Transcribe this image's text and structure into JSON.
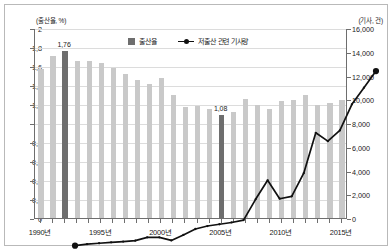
{
  "chart_data": {
    "type": "bar",
    "title": "",
    "subtitle": "",
    "xlabel": "",
    "ylabel": "(출산율, %)",
    "y2label": "(기사, 건)",
    "grid": true,
    "legend_position": "top-center",
    "x": [
      1990,
      1991,
      1992,
      1993,
      1994,
      1995,
      1996,
      1997,
      1998,
      1999,
      2000,
      2001,
      2002,
      2003,
      2004,
      2005,
      2006,
      2007,
      2008,
      2009,
      2010,
      2011,
      2012,
      2013,
      2014,
      2015
    ],
    "categories": [
      "1990",
      "1991",
      "1992",
      "1993",
      "1994",
      "1995",
      "1996",
      "1997",
      "1998",
      "1999",
      "2000",
      "2001",
      "2002",
      "2003",
      "2004",
      "2005",
      "2006",
      "2007",
      "2008",
      "2009",
      "2010",
      "2011",
      "2012",
      "2013",
      "2014",
      "2015"
    ],
    "xlim": [
      1989.5,
      2015.5
    ],
    "ylim": [
      0,
      2
    ],
    "y2lim": [
      0,
      16000
    ],
    "yticks": [
      0,
      0.2,
      0.4,
      0.6,
      0.8,
      1,
      1.2,
      1.4,
      1.6,
      1.8,
      2
    ],
    "ytick_labels": [
      "0",
      "0,2",
      "0,4",
      "0,6",
      "0,8",
      "1",
      "1,2",
      "1,4",
      "1,6",
      "1,8",
      "2"
    ],
    "y2ticks": [
      0,
      2000,
      4000,
      6000,
      8000,
      10000,
      12000,
      14000,
      16000
    ],
    "y2tick_labels": [
      "0",
      "2,000",
      "4,000",
      "6,000",
      "8,000",
      "10,000",
      "12,000",
      "14,000",
      "16,000"
    ],
    "xticks": [
      1990,
      1995,
      2000,
      2005,
      2010,
      2015
    ],
    "xtick_labels": [
      "1990년",
      "1995년",
      "2000년",
      "2005년",
      "2010년",
      "2015년"
    ],
    "series": [
      {
        "name": "출산율",
        "type": "bar",
        "axis": "left",
        "color": "#c9c9c9",
        "highlight_color": "#6e6e6e",
        "values": [
          1.57,
          1.71,
          1.76,
          1.65,
          1.65,
          1.63,
          1.58,
          1.52,
          1.45,
          1.41,
          1.47,
          1.3,
          1.17,
          1.18,
          1.15,
          1.08,
          1.12,
          1.25,
          1.19,
          1.15,
          1.23,
          1.24,
          1.3,
          1.19,
          1.21,
          1.24
        ],
        "highlight_indices": [
          2,
          15
        ],
        "point_labels": [
          {
            "index": 2,
            "text": "1,76"
          },
          {
            "index": 15,
            "text": "1,08"
          }
        ]
      },
      {
        "name": "저출산 관련 기사량",
        "type": "line",
        "axis": "right",
        "color": "#111111",
        "values": [
          200,
          320,
          400,
          480,
          540,
          620,
          900,
          900,
          640,
          1100,
          1600,
          1850,
          2000,
          2150,
          2350,
          4100,
          5700,
          4150,
          4350,
          6300,
          9700,
          9000,
          9900,
          12100,
          13500,
          14900
        ]
      }
    ]
  },
  "legend": {
    "entries": [
      {
        "label": "출산율",
        "marker": "square-swatch"
      },
      {
        "label": "저출산 관련 기사량",
        "marker": "line-dot"
      }
    ]
  },
  "colors": {
    "bar": "#c9c9c9",
    "bar_highlight": "#6e6e6e",
    "line": "#111111",
    "grid": "#dcdcdc",
    "axis": "#6e6e6e",
    "frame": "#b9b9b9",
    "text": "#1a1a1a",
    "background": "#ffffff"
  }
}
